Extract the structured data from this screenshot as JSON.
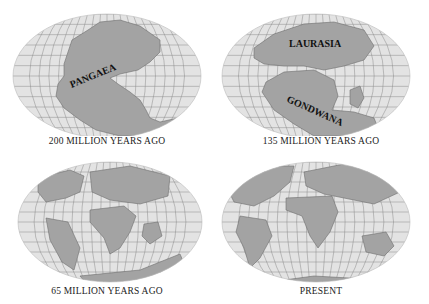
{
  "figure": {
    "panels": [
      {
        "caption": "200 MILLION YEARS AGO",
        "labels": [
          "PANGAEA"
        ]
      },
      {
        "caption": "135 MILLION YEARS AGO",
        "labels": [
          "LAURASIA",
          "GONDWANA"
        ]
      },
      {
        "caption": "65 MILLION YEARS AGO",
        "labels": []
      },
      {
        "caption": "PRESENT",
        "labels": []
      }
    ],
    "colors": {
      "ocean": "#e3e3e3",
      "land": "#a3a3a3",
      "grid": "#8a8a8a",
      "coast": "#6e6e6e"
    }
  }
}
